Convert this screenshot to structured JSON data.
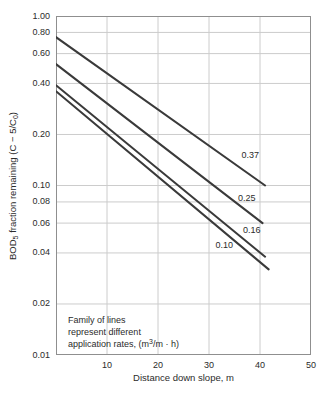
{
  "colors": {
    "line": "#3a3a3a",
    "grid": "#cccccc",
    "frame": "#8f8f8f",
    "text": "#2b2b2b",
    "background": "#ffffff"
  },
  "chart_data": {
    "type": "line",
    "title": "",
    "grid": true,
    "x_axis": {
      "title": "Distance down slope, m",
      "min": 0,
      "max": 50,
      "tick_values": [
        10,
        20,
        30,
        40,
        50
      ],
      "tick_labels": [
        "10",
        "20",
        "30",
        "40",
        "50"
      ],
      "gridline_values": [
        10,
        20,
        30,
        40
      ]
    },
    "y_axis": {
      "title_runs": [
        {
          "t": "BOD"
        },
        {
          "t": "5",
          "style": "sub"
        },
        {
          "t": " fraction remaining (C − 5/C"
        },
        {
          "t": "0",
          "style": "sub"
        },
        {
          "t": ")"
        }
      ],
      "title_text": "BOD5 fraction remaining (C − 5/C0)",
      "scale": "log",
      "min": 0.01,
      "max": 1.0,
      "tick_values": [
        1.0,
        0.8,
        0.6,
        0.4,
        0.2,
        0.1,
        0.08,
        0.06,
        0.04,
        0.02,
        0.01
      ],
      "tick_labels": [
        "1.00",
        "0.80",
        "0.60",
        "0.40",
        "0.20",
        "0.10",
        "0.08",
        "0.06",
        "0.04",
        "0.02",
        "0.01"
      ],
      "gridline_values": [
        0.8,
        0.6,
        0.4,
        0.2,
        0.1,
        0.08,
        0.06,
        0.04,
        0.02
      ]
    },
    "series": [
      {
        "name": "application rate 0.37",
        "label": "0.37",
        "points": [
          [
            0,
            0.75
          ],
          [
            41,
            0.1
          ]
        ],
        "label_pos": [
          38.1,
          0.15
        ]
      },
      {
        "name": "application rate 0.25",
        "label": "0.25",
        "points": [
          [
            0,
            0.52
          ],
          [
            40.5,
            0.06
          ]
        ],
        "label_pos": [
          37.4,
          0.084
        ]
      },
      {
        "name": "application rate 0.16",
        "label": "0.16",
        "points": [
          [
            0,
            0.39
          ],
          [
            41,
            0.038
          ]
        ],
        "label_pos": [
          38.4,
          0.054
        ]
      },
      {
        "name": "application rate 0.10",
        "label": "0.10",
        "points": [
          [
            0,
            0.36
          ],
          [
            41.7,
            0.032
          ]
        ],
        "label_pos": [
          33.0,
          0.044
        ]
      }
    ],
    "annotation": {
      "note_lines": [
        [
          {
            "t": "Family of lines"
          }
        ],
        [
          {
            "t": "represent different"
          }
        ],
        [
          {
            "t": "application rates, (m"
          },
          {
            "t": "3",
            "style": "sup"
          },
          {
            "t": "/m · h)"
          }
        ]
      ],
      "note_text": "Family of lines represent different application rates, (m3/m · h)"
    },
    "legend": "none"
  }
}
